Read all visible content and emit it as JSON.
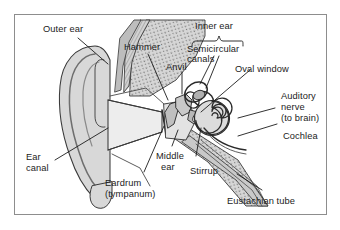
{
  "figure": {
    "frame_color": "#8d8d8d",
    "background_color": "#ffffff",
    "ink_color": "#1c1c1c",
    "tissue_fill": "#d8d8d8",
    "bone_fill": "#c4c4c4",
    "canal_fill": "#ededed"
  },
  "labels": {
    "outer_ear": "Outer ear",
    "hammer": "Hammer",
    "anvil": "Anvil",
    "inner_ear": "Inner ear",
    "semicircular_canals_l1": "Semicircular",
    "semicircular_canals_l2": "canals",
    "oval_window": "Oval window",
    "auditory_nerve_l1": "Auditory",
    "auditory_nerve_l2": "nerve",
    "auditory_nerve_l3": "(to brain)",
    "cochlea": "Cochlea",
    "ear_canal_l1": "Ear",
    "ear_canal_l2": "canal",
    "middle_ear_l1": "Middle",
    "middle_ear_l2": "ear",
    "eardrum_l1": "Eardrum",
    "eardrum_l2": "(tympanum)",
    "stirrup": "Stirrup",
    "eustachian_tube": "Eustachian tube"
  }
}
